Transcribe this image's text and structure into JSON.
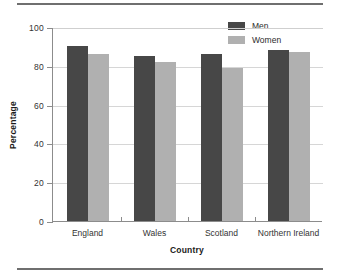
{
  "chart_data": {
    "type": "bar",
    "title": "",
    "xlabel": "Country",
    "ylabel": "Percentage",
    "categories": [
      "England",
      "Wales",
      "Scotland",
      "Northern Ireland"
    ],
    "series": [
      {
        "name": "Men",
        "color": "#474747",
        "values": [
          90,
          85,
          86,
          88
        ]
      },
      {
        "name": "Women",
        "color": "#b0b0b0",
        "values": [
          86,
          82,
          79,
          87
        ]
      }
    ],
    "ylim": [
      0,
      100
    ],
    "yticks": [
      0,
      20,
      40,
      60,
      80,
      100
    ],
    "ytick_labels": [
      "0",
      "20",
      "40",
      "60",
      "80",
      "100"
    ],
    "grid": true,
    "legend_position": "top-right"
  }
}
